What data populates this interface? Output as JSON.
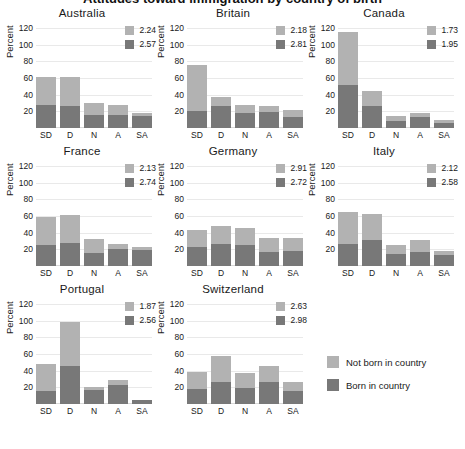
{
  "suptitle": "Attitudes toward immigration by country of birth",
  "chart_data": {
    "type": "bar",
    "subtype": "stacked-bar-small-multiples",
    "title": "Attitudes toward immigration by country of birth",
    "xlabel": "",
    "ylabel": "Percent",
    "categories": [
      "SD",
      "D",
      "N",
      "A",
      "SA"
    ],
    "yticks": [
      20,
      40,
      60,
      80,
      100,
      120
    ],
    "ylim": [
      0,
      125
    ],
    "grid": true,
    "legend_position": "bottom-right",
    "series": [
      {
        "name": "Not born in country",
        "color": "#b2b2b2"
      },
      {
        "name": "Born in country",
        "color": "#787878"
      }
    ],
    "panels": [
      {
        "name": "Australia",
        "means": {
          "not_born": "2.24",
          "born": "2.57"
        },
        "not_born": [
          33,
          35,
          14,
          12,
          3
        ],
        "born": [
          28,
          26,
          16,
          16,
          15
        ]
      },
      {
        "name": "Britain",
        "means": {
          "not_born": "2.18",
          "born": "2.81"
        },
        "not_born": [
          55,
          11,
          10,
          8,
          9
        ],
        "born": [
          21,
          26,
          18,
          19,
          13
        ]
      },
      {
        "name": "Canada",
        "means": {
          "not_born": "1.73",
          "born": "1.95"
        },
        "not_born": [
          63,
          19,
          6,
          5,
          4
        ],
        "born": [
          52,
          26,
          9,
          13,
          6
        ]
      },
      {
        "name": "France",
        "means": {
          "not_born": "2.13",
          "born": "2.74"
        },
        "not_born": [
          34,
          33,
          16,
          6,
          4
        ],
        "born": [
          25,
          28,
          16,
          21,
          19
        ]
      },
      {
        "name": "Germany",
        "means": {
          "not_born": "2.91",
          "born": "2.72"
        },
        "not_born": [
          20,
          22,
          21,
          17,
          16
        ],
        "born": [
          23,
          26,
          25,
          17,
          18
        ]
      },
      {
        "name": "Italy",
        "means": {
          "not_born": "2.12",
          "born": "2.58"
        },
        "not_born": [
          38,
          32,
          11,
          14,
          5
        ],
        "born": [
          27,
          31,
          14,
          17,
          13
        ]
      },
      {
        "name": "Portugal",
        "means": {
          "not_born": "1.87",
          "born": "2.56"
        },
        "not_born": [
          32,
          53,
          4,
          6,
          0
        ],
        "born": [
          16,
          46,
          17,
          23,
          5
        ]
      },
      {
        "name": "Switzerland",
        "means": {
          "not_born": "2.63",
          "born": "2.98"
        },
        "not_born": [
          20,
          31,
          18,
          19,
          10
        ],
        "born": [
          18,
          27,
          19,
          27,
          16
        ]
      }
    ]
  },
  "legend": {
    "items": [
      {
        "label": "Not born in country",
        "color": "#b2b2b2"
      },
      {
        "label": "Born in country",
        "color": "#787878"
      }
    ]
  }
}
